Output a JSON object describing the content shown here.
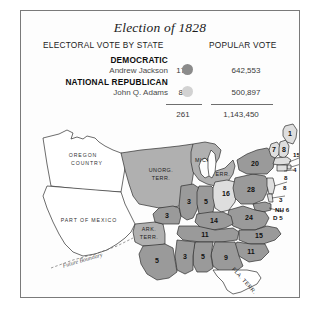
{
  "figure": {
    "title": "Election of 1828"
  },
  "legend": {
    "headers": {
      "electoral": "ELECTORAL VOTE BY STATE",
      "popular": "POPULAR VOTE"
    },
    "rows": [
      {
        "party": "DEMOCRATIC",
        "candidate": "Andrew Jackson",
        "electoral": "178",
        "popular": "642,553",
        "color": "#8b8b8b"
      },
      {
        "party": "NATIONAL REPUBLICAN",
        "candidate": "John Q. Adams",
        "electoral": "83",
        "popular": "500,897",
        "color": "#d2d2d2"
      }
    ],
    "totals": {
      "electoral": "261",
      "popular": "1,143,450"
    }
  },
  "map": {
    "open_areas": [
      {
        "name": "oregon-country",
        "label_line1": "OREGON",
        "label_line2": "COUNTRY"
      },
      {
        "name": "part-of-mexico",
        "label": "PART OF MEXICO"
      }
    ],
    "territories": [
      {
        "name": "unorganized-territory",
        "label_line1": "UNORG.",
        "label_line2": "TERR."
      },
      {
        "name": "michigan-territory",
        "label_line1": "MICH.",
        "label_line2": "TERR."
      },
      {
        "name": "arkansas-territory",
        "label_line1": "ARK.",
        "label_line2": "TERR."
      },
      {
        "name": "florida-territory",
        "label": "FLA. TERR."
      }
    ],
    "annotations": [
      {
        "name": "future-boundary",
        "label": "Future Boundary"
      }
    ],
    "states": [
      {
        "name": "maine",
        "votes": "1",
        "party": "national-republican"
      },
      {
        "name": "new-hampshire",
        "votes": "8",
        "party": "national-republican"
      },
      {
        "name": "vermont",
        "votes": "7",
        "party": "national-republican"
      },
      {
        "name": "new-york",
        "votes": "20",
        "party": "democratic"
      },
      {
        "name": "massachusetts",
        "votes": "15",
        "party": "national-republican"
      },
      {
        "name": "rhode-island",
        "votes": "4",
        "party": "national-republican"
      },
      {
        "name": "connecticut",
        "votes": "8",
        "party": "national-republican"
      },
      {
        "name": "new-jersey",
        "votes": "8",
        "party": "national-republican"
      },
      {
        "name": "delaware",
        "votes": "3",
        "party": "national-republican"
      },
      {
        "name": "maryland",
        "votes": "5",
        "party": "democratic"
      },
      {
        "name": "pennsylvania",
        "votes": "28",
        "party": "democratic"
      },
      {
        "name": "ohio",
        "votes": "16",
        "party": "national-republican"
      },
      {
        "name": "indiana",
        "votes": "5",
        "party": "democratic"
      },
      {
        "name": "illinois",
        "votes": "3",
        "party": "democratic"
      },
      {
        "name": "missouri",
        "votes": "3",
        "party": "democratic"
      },
      {
        "name": "kentucky",
        "votes": "14",
        "party": "democratic"
      },
      {
        "name": "virginia",
        "votes": "24",
        "party": "democratic"
      },
      {
        "name": "north-carolina",
        "votes": "15",
        "party": "democratic"
      },
      {
        "name": "tennessee",
        "votes": "11",
        "party": "democratic"
      },
      {
        "name": "south-carolina",
        "votes": "11",
        "party": "democratic"
      },
      {
        "name": "georgia",
        "votes": "9",
        "party": "democratic"
      },
      {
        "name": "alabama",
        "votes": "5",
        "party": "democratic"
      },
      {
        "name": "mississippi",
        "votes": "3",
        "party": "democratic"
      },
      {
        "name": "louisiana",
        "votes": "5",
        "party": "democratic"
      }
    ],
    "callouts": [
      {
        "name": "massachusetts-callout",
        "label": "15"
      },
      {
        "name": "rhode-island-callout",
        "label": "4"
      },
      {
        "name": "connecticut-callout",
        "label": "8"
      },
      {
        "name": "new-jersey-callout",
        "label": "8"
      },
      {
        "name": "delaware-callout",
        "label": "3"
      },
      {
        "name": "maryland-callout-prefix",
        "label": "NH 6"
      },
      {
        "name": "maryland-callout",
        "label": "D  5"
      }
    ]
  }
}
